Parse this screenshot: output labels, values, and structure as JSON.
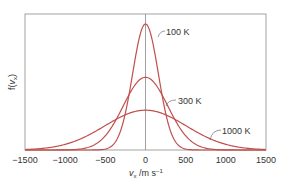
{
  "chart_data": {
    "type": "line",
    "title": "",
    "xlabel": "v_x /m s^-1",
    "ylabel": "f(v_x)",
    "xlim": [
      -1500,
      1500
    ],
    "ylim": [
      0,
      1
    ],
    "grid": false,
    "legend": "inline labels",
    "x_ticks": [
      -1500,
      -1000,
      -500,
      0,
      500,
      1000,
      1500
    ],
    "x_tick_labels": [
      "−1500",
      "−1000",
      "−500",
      "0",
      "500",
      "1000",
      "1500"
    ],
    "series": [
      {
        "name": "100 K",
        "label": "100 K",
        "temperature": 100,
        "sigma": 160,
        "relative_peak": 1.0
      },
      {
        "name": "300 K",
        "label": "300 K",
        "temperature": 300,
        "sigma": 277,
        "relative_peak": 0.577
      },
      {
        "name": "1000 K",
        "label": "1000 K",
        "temperature": 1000,
        "sigma": 506,
        "relative_peak": 0.316
      }
    ],
    "annotations": [
      "100 K",
      "300 K",
      "1000 K"
    ],
    "curve_color": "#c0504d"
  },
  "axis": {
    "ylabel_main": "f(",
    "ylabel_var": "v",
    "ylabel_sub": "x",
    "ylabel_end": ")",
    "xlabel_var": "v",
    "xlabel_sub": "x",
    "xlabel_units": " /m s",
    "xlabel_exp": "−1"
  }
}
